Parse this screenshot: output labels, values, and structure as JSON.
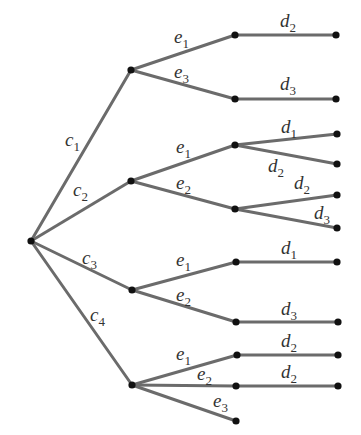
{
  "diagram": {
    "type": "tree",
    "orientation": "left-to-right",
    "colors": {
      "edge": "#6b6b6b",
      "node": "#111111",
      "label": "#333333",
      "background": "#ffffff"
    },
    "root": {
      "id": "root",
      "x": 31,
      "y": 241
    },
    "nodes": [
      {
        "id": "c1",
        "x": 131,
        "y": 70
      },
      {
        "id": "c2",
        "x": 131,
        "y": 181
      },
      {
        "id": "c3",
        "x": 132,
        "y": 290
      },
      {
        "id": "c4",
        "x": 132,
        "y": 385
      },
      {
        "id": "c1e1",
        "x": 235,
        "y": 35
      },
      {
        "id": "c1e3",
        "x": 235,
        "y": 99
      },
      {
        "id": "c2e1",
        "x": 235,
        "y": 145
      },
      {
        "id": "c2e2",
        "x": 235,
        "y": 209
      },
      {
        "id": "c3e1",
        "x": 236,
        "y": 262
      },
      {
        "id": "c3e2",
        "x": 236,
        "y": 322
      },
      {
        "id": "c4e1",
        "x": 237,
        "y": 355
      },
      {
        "id": "c4e2",
        "x": 236,
        "y": 386
      },
      {
        "id": "c4e3",
        "x": 236,
        "y": 421
      },
      {
        "id": "c1e1d2",
        "x": 336,
        "y": 35
      },
      {
        "id": "c1e3d3",
        "x": 336,
        "y": 99
      },
      {
        "id": "c2e1d1",
        "x": 337,
        "y": 134
      },
      {
        "id": "c2e1d2",
        "x": 337,
        "y": 164
      },
      {
        "id": "c2e2d2",
        "x": 337,
        "y": 195
      },
      {
        "id": "c2e2d3",
        "x": 337,
        "y": 228
      },
      {
        "id": "c3e1d1",
        "x": 337,
        "y": 262
      },
      {
        "id": "c3e2d3",
        "x": 338,
        "y": 322
      },
      {
        "id": "c4e1d2",
        "x": 338,
        "y": 355
      },
      {
        "id": "c4e2d2",
        "x": 338,
        "y": 386
      }
    ],
    "edges": [
      {
        "from": "root",
        "to": "c1",
        "label": {
          "base": "c",
          "sub": "1",
          "x": 65,
          "y": 146
        }
      },
      {
        "from": "root",
        "to": "c2",
        "label": {
          "base": "c",
          "sub": "2",
          "x": 73,
          "y": 196
        }
      },
      {
        "from": "root",
        "to": "c3",
        "label": {
          "base": "c",
          "sub": "3",
          "x": 82,
          "y": 264
        }
      },
      {
        "from": "root",
        "to": "c4",
        "label": {
          "base": "c",
          "sub": "4",
          "x": 90,
          "y": 321
        }
      },
      {
        "from": "c1",
        "to": "c1e1",
        "label": {
          "base": "e",
          "sub": "1",
          "x": 174,
          "y": 43
        }
      },
      {
        "from": "c1",
        "to": "c1e3",
        "label": {
          "base": "e",
          "sub": "3",
          "x": 174,
          "y": 78
        }
      },
      {
        "from": "c2",
        "to": "c2e1",
        "label": {
          "base": "e",
          "sub": "1",
          "x": 176,
          "y": 153
        }
      },
      {
        "from": "c2",
        "to": "c2e2",
        "label": {
          "base": "e",
          "sub": "2",
          "x": 176,
          "y": 189
        }
      },
      {
        "from": "c3",
        "to": "c3e1",
        "label": {
          "base": "e",
          "sub": "1",
          "x": 176,
          "y": 266
        }
      },
      {
        "from": "c3",
        "to": "c3e2",
        "label": {
          "base": "e",
          "sub": "2",
          "x": 176,
          "y": 301
        }
      },
      {
        "from": "c4",
        "to": "c4e1",
        "label": {
          "base": "e",
          "sub": "1",
          "x": 176,
          "y": 360
        }
      },
      {
        "from": "c4",
        "to": "c4e2",
        "label": {
          "base": "e",
          "sub": "2",
          "x": 197,
          "y": 380
        }
      },
      {
        "from": "c4",
        "to": "c4e3",
        "label": {
          "base": "e",
          "sub": "3",
          "x": 213,
          "y": 407
        }
      },
      {
        "from": "c1e1",
        "to": "c1e1d2",
        "label": {
          "base": "d",
          "sub": "2",
          "x": 280,
          "y": 27
        }
      },
      {
        "from": "c1e3",
        "to": "c1e3d3",
        "label": {
          "base": "d",
          "sub": "3",
          "x": 280,
          "y": 90
        }
      },
      {
        "from": "c2e1",
        "to": "c2e1d1",
        "label": {
          "base": "d",
          "sub": "1",
          "x": 281,
          "y": 133
        }
      },
      {
        "from": "c2e1",
        "to": "c2e1d2",
        "label": {
          "base": "d",
          "sub": "2",
          "x": 268,
          "y": 172
        }
      },
      {
        "from": "c2e2",
        "to": "c2e2d2",
        "label": {
          "base": "d",
          "sub": "2",
          "x": 294,
          "y": 189
        }
      },
      {
        "from": "c2e2",
        "to": "c2e2d3",
        "label": {
          "base": "d",
          "sub": "3",
          "x": 314,
          "y": 219
        }
      },
      {
        "from": "c3e1",
        "to": "c3e1d1",
        "label": {
          "base": "d",
          "sub": "1",
          "x": 281,
          "y": 254
        }
      },
      {
        "from": "c3e2",
        "to": "c3e2d3",
        "label": {
          "base": "d",
          "sub": "3",
          "x": 281,
          "y": 315
        }
      },
      {
        "from": "c4e1",
        "to": "c4e1d2",
        "label": {
          "base": "d",
          "sub": "2",
          "x": 281,
          "y": 347
        }
      },
      {
        "from": "c4e2",
        "to": "c4e2d2",
        "label": {
          "base": "d",
          "sub": "2",
          "x": 281,
          "y": 378
        }
      }
    ]
  }
}
